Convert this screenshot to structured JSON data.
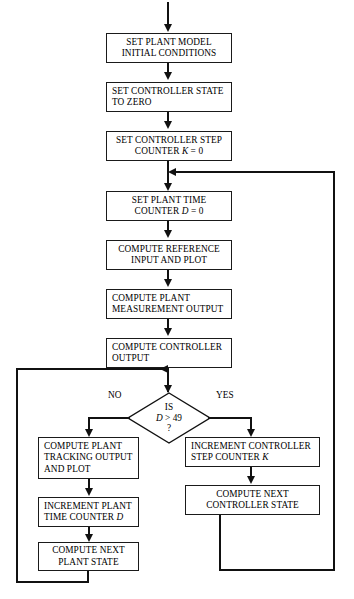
{
  "diagram": {
    "type": "flowchart",
    "nodes": [
      {
        "id": "set-plant-model",
        "shape": "process",
        "align": "center",
        "lines": [
          "SET PLANT MODEL",
          "INITIAL CONDITIONS"
        ]
      },
      {
        "id": "set-controller-state",
        "shape": "process",
        "align": "left",
        "lines": [
          "SET CONTROLLER STATE",
          "TO ZERO"
        ]
      },
      {
        "id": "set-controller-step-counter",
        "shape": "process",
        "align": "center",
        "lines": [
          "SET CONTROLLER STEP",
          "COUNTER K = 0"
        ],
        "italic_symbol": "K"
      },
      {
        "id": "set-plant-time-counter",
        "shape": "process",
        "align": "center",
        "lines": [
          "SET PLANT TIME",
          "COUNTER D = 0"
        ],
        "italic_symbol": "D"
      },
      {
        "id": "compute-reference-input",
        "shape": "process",
        "align": "center",
        "lines": [
          "COMPUTE REFERENCE",
          "INPUT AND PLOT"
        ]
      },
      {
        "id": "compute-plant-measurement",
        "shape": "process",
        "align": "left",
        "lines": [
          "COMPUTE PLANT",
          "MEASUREMENT OUTPUT"
        ]
      },
      {
        "id": "compute-controller-output",
        "shape": "process",
        "align": "left",
        "lines": [
          "COMPUTE CONTROLLER",
          "OUTPUT"
        ]
      },
      {
        "id": "decision-d-gt-49",
        "shape": "decision",
        "lines": [
          "IS",
          "D > 49",
          "?"
        ],
        "italic_symbol": "D"
      },
      {
        "id": "compute-plant-tracking",
        "shape": "process",
        "align": "left",
        "lines": [
          "COMPUTE PLANT",
          "TRACKING OUTPUT",
          "AND PLOT"
        ]
      },
      {
        "id": "increment-plant-time-counter",
        "shape": "process",
        "align": "left",
        "lines": [
          "INCREMENT PLANT",
          "TIME COUNTER D"
        ],
        "italic_symbol": "D"
      },
      {
        "id": "compute-next-plant-state",
        "shape": "process",
        "align": "center",
        "lines": [
          "COMPUTE NEXT",
          "PLANT STATE"
        ]
      },
      {
        "id": "increment-controller-step-counter",
        "shape": "process",
        "align": "left",
        "lines": [
          "INCREMENT CONTROLLER",
          "STEP COUNTER K"
        ],
        "italic_symbol": "K"
      },
      {
        "id": "compute-next-controller-state",
        "shape": "process",
        "align": "center",
        "lines": [
          "COMPUTE NEXT",
          "CONTROLLER STATE"
        ]
      }
    ],
    "edge_labels": {
      "no": "NO",
      "yes": "YES"
    },
    "colors": {
      "stroke": "#111111",
      "fill": "#ffffff",
      "text": "#000000"
    }
  }
}
